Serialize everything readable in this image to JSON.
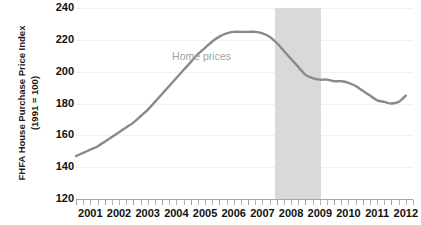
{
  "chart_data": {
    "type": "line",
    "title": "",
    "xlabel": "",
    "ylabel": "FHFA House Purchase Price Index (1991 = 100)",
    "ylabel_lines": [
      "FHFA House Purchase Price Index",
      "(1991 = 100)"
    ],
    "ylim": [
      120,
      240
    ],
    "y_ticks": [
      120,
      140,
      160,
      180,
      200,
      220,
      240
    ],
    "xlim": [
      2001,
      2012.75
    ],
    "x_tick_labels": [
      "2001",
      "2002",
      "2003",
      "2004",
      "2005",
      "2006",
      "2007",
      "2008",
      "2009",
      "2010",
      "2011",
      "2012"
    ],
    "x_minor_ticks_per_year": 4,
    "grid": true,
    "legend": "none",
    "line_color": "#8a8a8a",
    "annotations": [
      {
        "text": "Home prices",
        "x": 2004.35,
        "y": 209,
        "color": "#a0a0a0"
      }
    ],
    "shaded_regions": [
      {
        "name": "recession-band",
        "x_start": 2007.95,
        "x_end": 2009.55,
        "color": "#d9d9d9"
      }
    ],
    "series": [
      {
        "name": "Home prices",
        "color": "#8a8a8a",
        "x": [
          2001.0,
          2001.25,
          2001.5,
          2001.75,
          2002.0,
          2002.25,
          2002.5,
          2002.75,
          2003.0,
          2003.25,
          2003.5,
          2003.75,
          2004.0,
          2004.25,
          2004.5,
          2004.75,
          2005.0,
          2005.25,
          2005.5,
          2005.75,
          2006.0,
          2006.25,
          2006.5,
          2006.75,
          2007.0,
          2007.25,
          2007.5,
          2007.75,
          2008.0,
          2008.25,
          2008.5,
          2008.75,
          2009.0,
          2009.25,
          2009.5,
          2009.75,
          2010.0,
          2010.25,
          2010.5,
          2010.75,
          2011.0,
          2011.25,
          2011.5,
          2011.75,
          2012.0,
          2012.25,
          2012.5
        ],
        "values": [
          147,
          149,
          151,
          153,
          156,
          159,
          162,
          165,
          168,
          172,
          176,
          181,
          186,
          191,
          196,
          201,
          206,
          211,
          215,
          219,
          222,
          224,
          225,
          225,
          225,
          225,
          224,
          222,
          218,
          213,
          208,
          203,
          198,
          196,
          195,
          195,
          194,
          194,
          193,
          191,
          188,
          185,
          182,
          181,
          180,
          181,
          185
        ]
      }
    ]
  }
}
